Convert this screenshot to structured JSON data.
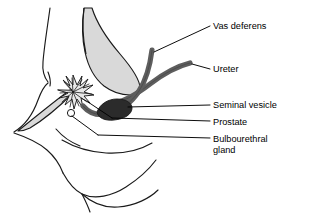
{
  "figure": {
    "background_color": "#ffffff",
    "outline_color": "#1a1a1a",
    "bladder_fill": "#d9d9d9",
    "tube_fill": "#5e5e5e",
    "vesicle_fill": "#2b2b2b",
    "leader_color": "#000000"
  },
  "labels": {
    "vas_deferens": "Vas deferens",
    "ureter": "Ureter",
    "seminal_vesicle": "Seminal vesicle",
    "prostate": "Prostate",
    "bulbourethral_gland": "Bulbourethral\ngland"
  },
  "structures": [
    {
      "name": "vas-deferens",
      "label": "Vas deferens",
      "fill": "#5e5e5e"
    },
    {
      "name": "ureter",
      "label": "Ureter",
      "fill": "#5e5e5e"
    },
    {
      "name": "seminal-vesicle",
      "label": "Seminal vesicle",
      "fill": "#2b2b2b"
    },
    {
      "name": "prostate",
      "label": "Prostate",
      "fill": "#d9d9d9"
    },
    {
      "name": "bulbourethral-gland",
      "label": "Bulbourethral gland",
      "fill": "#ffffff"
    },
    {
      "name": "urinary-bladder",
      "label": "",
      "fill": "#d9d9d9"
    }
  ]
}
